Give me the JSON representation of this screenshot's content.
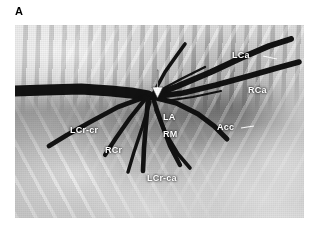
{
  "figure": {
    "panel_label": "A",
    "type": "radiograph",
    "modality": "thoracic bronchogram, lateral projection"
  },
  "image": {
    "frame": {
      "x": 15,
      "y": 25,
      "width": 289,
      "height": 193
    },
    "background_color": "#8a8a8a",
    "label_color": "#ffffff",
    "airway_color": "#0d0d0d"
  },
  "annotations": [
    {
      "id": "lca",
      "text": "LCa",
      "x": 232,
      "y": 50,
      "name": "label-left-caudal-bronchus"
    },
    {
      "id": "rca",
      "text": "RCa",
      "x": 248,
      "y": 85,
      "name": "label-right-caudal-bronchus"
    },
    {
      "id": "acc",
      "text": "Acc",
      "x": 217,
      "y": 122,
      "name": "label-accessory-bronchus"
    },
    {
      "id": "la",
      "text": "LA",
      "x": 163,
      "y": 112,
      "name": "label-left-cranial-bronchus"
    },
    {
      "id": "rm",
      "text": "RM",
      "x": 163,
      "y": 129,
      "name": "label-right-middle-bronchus"
    },
    {
      "id": "lcrcr",
      "text": "LCr-cr",
      "x": 70,
      "y": 125,
      "name": "label-left-cranial-cranial-bronchus"
    },
    {
      "id": "rcr",
      "text": "RCr",
      "x": 105,
      "y": 145,
      "name": "label-right-cranial-bronchus"
    },
    {
      "id": "lcrca",
      "text": "LCr-ca",
      "x": 147,
      "y": 173,
      "name": "label-left-cranial-caudal-bronchus"
    }
  ],
  "markers": [
    {
      "id": "carina-arrow",
      "name": "carina-arrow-marker",
      "shape": "down-arrow",
      "color": "#ffffff",
      "x": 157,
      "y": 70,
      "length": 28
    }
  ],
  "leader_lines": [
    {
      "id": "acc-leader",
      "name": "acc-leader-line",
      "x1": 241,
      "y1": 128,
      "x2": 252,
      "y2": 126
    },
    {
      "id": "lca-leader",
      "name": "lca-leader-line",
      "x1": 262,
      "y1": 56,
      "x2": 276,
      "y2": 59
    }
  ],
  "airways": {
    "trachea": {
      "name": "trachea",
      "points": "15,91 45,90 80,89 110,91 128,93 142,95"
    },
    "carina": {
      "name": "carina",
      "x": 152,
      "y": 96
    },
    "branches": [
      {
        "id": "lca",
        "name": "airway-left-caudal",
        "points": "152,96 178,86 210,72 240,58 268,46 288,39"
      },
      {
        "id": "rca",
        "name": "airway-right-caudal",
        "points": "152,96 182,92 215,85 248,76 276,68 296,62"
      },
      {
        "id": "acc",
        "name": "airway-accessory",
        "points": "152,96 176,102 198,113 214,125 226,137"
      },
      {
        "id": "la",
        "name": "airway-left-cranial",
        "points": "152,96 168,70 180,54 188,44"
      },
      {
        "id": "rm",
        "name": "airway-right-middle",
        "points": "152,96 160,120 168,144 178,162"
      },
      {
        "id": "lcrca",
        "name": "airway-left-cranial-caudal",
        "points": "148,97 146,122 144,146 142,168"
      },
      {
        "id": "rcr",
        "name": "airway-right-cranial",
        "points": "146,97 130,116 116,136 104,152"
      },
      {
        "id": "lcrcr",
        "name": "airway-left-cranial-cranial",
        "points": "145,96 118,106 92,120 66,134 48,144"
      },
      {
        "id": "sub1",
        "name": "airway-branch-ventral-1",
        "points": "150,100 142,126 134,150 128,170"
      },
      {
        "id": "sub2",
        "name": "airway-branch-ventral-2",
        "points": "156,108 166,132 178,152 190,166"
      },
      {
        "id": "sub3",
        "name": "airway-branch-cranial-small",
        "points": "140,95 112,92 86,90 62,90"
      }
    ]
  }
}
